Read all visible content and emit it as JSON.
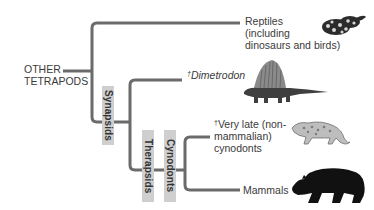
{
  "root": {
    "label_line1": "OTHER",
    "label_line2": "TETRAPODS"
  },
  "taxa": {
    "reptiles": {
      "line1": "Reptiles",
      "line2": "(including",
      "line3": "dinosaurs and birds)"
    },
    "dimetrodon": {
      "dagger": "†",
      "name": "Dimetrodon"
    },
    "late_cynodonts": {
      "dagger": "†",
      "line1": "Very late (non-",
      "line2": "mammalian)",
      "line3": "cynodonts"
    },
    "mammals": {
      "name": "Mammals"
    }
  },
  "clades": {
    "synapsids": "Synapsids",
    "therapsids": "Therapsids",
    "cynodonts": "Cynodonts"
  },
  "icons": {
    "reptiles": "snake-icon",
    "dimetrodon": "dimetrodon-icon",
    "late_cynodonts": "cynodont-icon",
    "mammals": "bear-icon"
  },
  "colors": {
    "branch": "#6b6b6b",
    "clade_box": "#cfcfcf",
    "text": "#3a3a3a"
  }
}
